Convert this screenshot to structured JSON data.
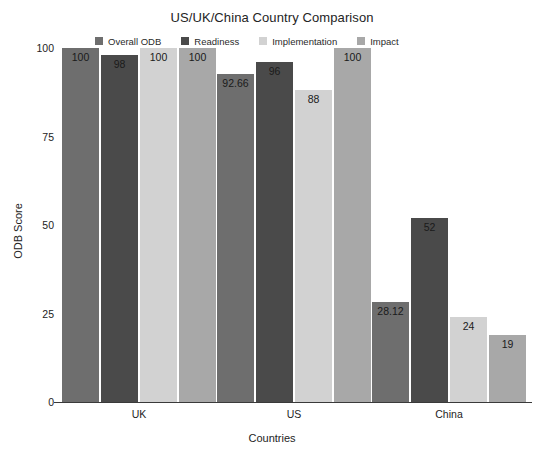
{
  "chart_data": {
    "type": "bar",
    "title": "US/UK/China Country Comparison",
    "xlabel": "Countries",
    "ylabel": "ODB Score",
    "categories": [
      "UK",
      "US",
      "China"
    ],
    "ylim": [
      0,
      100
    ],
    "yticks": [
      0,
      25,
      50,
      75,
      100
    ],
    "ytick_labels": [
      "0",
      "25",
      "50",
      "75",
      "100"
    ],
    "grid": false,
    "legend_position": "top",
    "bar_labels_shown": true,
    "series": [
      {
        "name": "Overall ODB",
        "color": "#6e6e6e",
        "values": [
          100,
          92.66,
          28.12
        ],
        "value_labels": [
          "100",
          "92.66",
          "28.12"
        ]
      },
      {
        "name": "Readiness",
        "color": "#4a4a4a",
        "values": [
          98,
          96,
          52
        ],
        "value_labels": [
          "98",
          "96",
          "52"
        ]
      },
      {
        "name": "Implementation",
        "color": "#d2d2d2",
        "values": [
          100,
          88,
          24
        ],
        "value_labels": [
          "100",
          "88",
          "24"
        ]
      },
      {
        "name": "Impact",
        "color": "#a8a8a8",
        "values": [
          100,
          100,
          19
        ],
        "value_labels": [
          "100",
          "100",
          "19"
        ]
      }
    ]
  }
}
